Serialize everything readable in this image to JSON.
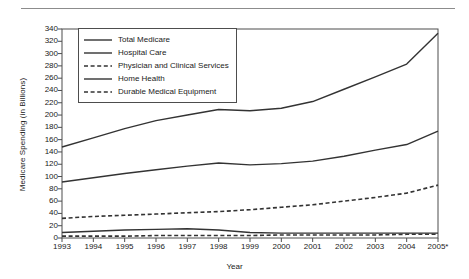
{
  "figure": {
    "top_rule": "horizontal-rule",
    "background_color": "#ffffff",
    "line_color": "#333333"
  },
  "chart_data": {
    "type": "line",
    "title": "",
    "xlabel": "Year",
    "ylabel": "Medicare Spending (in Billions)",
    "categories": [
      "1993",
      "1994",
      "1995",
      "1996",
      "1997",
      "1998",
      "1999",
      "2000",
      "2001",
      "2002",
      "2003",
      "2004",
      "2005*"
    ],
    "x_tick_labels": [
      "1993",
      "1994",
      "1995",
      "1996",
      "1997",
      "1998",
      "1999",
      "2000",
      "2001",
      "2002",
      "2003",
      "2004",
      "2005*"
    ],
    "y_tick_labels": [
      "0",
      "20",
      "40",
      "60",
      "80",
      "100",
      "120",
      "140",
      "160",
      "180",
      "200",
      "220",
      "240",
      "260",
      "280",
      "300",
      "320",
      "340"
    ],
    "ylim": [
      0,
      340
    ],
    "xlim": [
      "1993",
      "2005*"
    ],
    "y_tick_step": 20,
    "grid": false,
    "legend_position": "upper-left-inside",
    "series": [
      {
        "name": "Total Medicare",
        "style": "solid",
        "color": "#333333",
        "values": [
          148,
          163,
          178,
          191,
          200,
          209,
          207,
          211,
          222,
          242,
          262,
          283,
          333
        ]
      },
      {
        "name": "Hospital Care",
        "style": "solid",
        "color": "#333333",
        "values": [
          91,
          98,
          105,
          111,
          117,
          122,
          119,
          121,
          125,
          133,
          143,
          152,
          174
        ]
      },
      {
        "name": "Physician and Clinical Services",
        "style": "dashed",
        "color": "#333333",
        "values": [
          32,
          35,
          37,
          39,
          41,
          43,
          46,
          50,
          54,
          60,
          66,
          73,
          86
        ]
      },
      {
        "name": "Home Health",
        "style": "solid",
        "color": "#333333",
        "values": [
          9,
          11,
          13,
          14,
          15,
          13,
          9,
          8,
          8,
          8,
          8,
          8,
          8
        ]
      },
      {
        "name": "Durable Medical Equipment",
        "style": "dashed",
        "color": "#333333",
        "values": [
          3,
          3,
          3,
          4,
          4,
          4,
          4,
          5,
          5,
          5,
          5,
          6,
          6
        ]
      }
    ]
  }
}
